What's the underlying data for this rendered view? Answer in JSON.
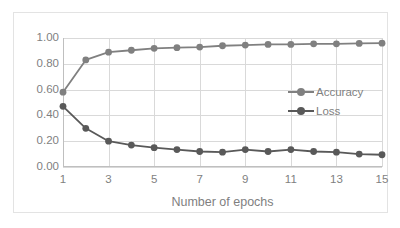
{
  "chart_data": {
    "type": "line",
    "title": "",
    "xlabel": "Number of epochs",
    "ylabel": "",
    "x": [
      1,
      2,
      3,
      4,
      5,
      6,
      7,
      8,
      9,
      10,
      11,
      12,
      13,
      14,
      15
    ],
    "xlim": [
      1,
      15
    ],
    "ylim": [
      0.0,
      1.0
    ],
    "xticks": [
      "1",
      "3",
      "5",
      "7",
      "9",
      "11",
      "13",
      "15"
    ],
    "xtick_values": [
      1,
      3,
      5,
      7,
      9,
      11,
      13,
      15
    ],
    "yticks": [
      "0.00",
      "0.20",
      "0.40",
      "0.60",
      "0.80",
      "1.00"
    ],
    "ytick_values": [
      0.0,
      0.2,
      0.4,
      0.6,
      0.8,
      1.0
    ],
    "grid": true,
    "legend_position": "right-inside",
    "series": [
      {
        "name": "Accuracy",
        "color": "#808080",
        "values": [
          0.58,
          0.83,
          0.89,
          0.905,
          0.92,
          0.925,
          0.93,
          0.94,
          0.945,
          0.95,
          0.95,
          0.955,
          0.955,
          0.958,
          0.96
        ]
      },
      {
        "name": "Loss",
        "color": "#595959",
        "values": [
          0.47,
          0.3,
          0.2,
          0.17,
          0.15,
          0.135,
          0.12,
          0.115,
          0.135,
          0.12,
          0.135,
          0.12,
          0.115,
          0.1,
          0.095
        ]
      }
    ]
  },
  "legend": {
    "items": [
      {
        "label": "Accuracy"
      },
      {
        "label": "Loss"
      }
    ]
  },
  "axes": {
    "x_title": "Number of epochs"
  }
}
